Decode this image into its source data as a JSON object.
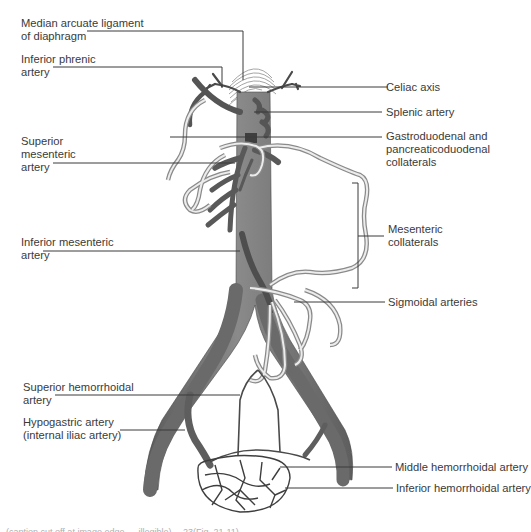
{
  "figure": {
    "colors": {
      "artery_fill": "#6e6e6e",
      "artery_dark": "#4a4a4a",
      "collateral_outline": "#8a8a8a",
      "collateral_fill": "#e6e6e6",
      "leader_line": "#3a3a3a",
      "label_text": "#3a3a3a",
      "ligament_hatch": "#9a9a9a"
    },
    "labels_left": [
      {
        "id": "median-arcuate-ligament",
        "lines": [
          "Median arcuate ligament",
          "of diaphragm"
        ]
      },
      {
        "id": "inferior-phrenic-artery",
        "lines": [
          "Inferior phrenic",
          "artery"
        ]
      },
      {
        "id": "superior-mesenteric-artery",
        "lines": [
          "Superior",
          "mesenteric",
          "artery"
        ]
      },
      {
        "id": "inferior-mesenteric-artery",
        "lines": [
          "Inferior mesenteric",
          "artery"
        ]
      },
      {
        "id": "superior-hemorrhoidal-artery",
        "lines": [
          "Superior hemorrhoidal",
          "artery"
        ]
      },
      {
        "id": "hypogastric-artery",
        "lines": [
          "Hypogastric artery",
          "(internal iliac artery)"
        ]
      }
    ],
    "labels_right": [
      {
        "id": "celiac-axis",
        "lines": [
          "Celiac axis"
        ]
      },
      {
        "id": "splenic-artery",
        "lines": [
          "Splenic artery"
        ]
      },
      {
        "id": "gastroduodenal-collaterals",
        "lines": [
          "Gastroduodenal and",
          "pancreaticoduodenal",
          "collaterals"
        ]
      },
      {
        "id": "mesenteric-collaterals",
        "lines": [
          "Mesenteric",
          "collaterals"
        ]
      },
      {
        "id": "sigmoidal-arteries",
        "lines": [
          "Sigmoidal arteries"
        ]
      },
      {
        "id": "middle-hemorrhoidal-artery",
        "lines": [
          "Middle hemorrhoidal artery"
        ]
      },
      {
        "id": "inferior-hemorrhoidal-artery",
        "lines": [
          "Inferior hemorrhoidal artery"
        ]
      }
    ],
    "caption_cropped": "(caption cut off at image edge — illegible) …23(Fig. 21-11)"
  }
}
